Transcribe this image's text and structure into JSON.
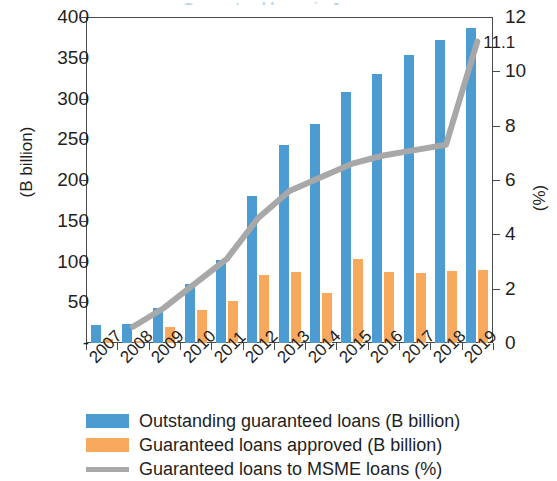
{
  "title_sliver": "Guaranteed loans in Japan",
  "chart_data": {
    "type": "bar",
    "title": "",
    "xlabel": "",
    "ylabel": "(B billion)",
    "y2label": "(%)",
    "categories": [
      "2007",
      "2008",
      "2009",
      "2010",
      "2011",
      "2012",
      "2013",
      "2014",
      "2015",
      "2016",
      "2017",
      "2018",
      "2019"
    ],
    "ylim": [
      0,
      400
    ],
    "yticks": [
      400,
      350,
      300,
      250,
      200,
      150,
      100,
      50,
      0
    ],
    "ytick_labels": [
      "400",
      "350",
      "300",
      "250",
      "200",
      "150",
      "100",
      "50",
      "-"
    ],
    "y2lim": [
      0,
      12
    ],
    "y2ticks": [
      12,
      10,
      8,
      6,
      4,
      2,
      0
    ],
    "y2tick_labels": [
      "12",
      "10",
      "8",
      "6",
      "4",
      "2",
      "0"
    ],
    "grid": false,
    "legend_position": "bottom",
    "series": [
      {
        "name": "Outstanding guaranteed loans (B billion)",
        "type": "bar",
        "axis": "left",
        "color": "#4c9bd1",
        "values": [
          22,
          23,
          43,
          72,
          102,
          180,
          243,
          269,
          308,
          330,
          353,
          372,
          387
        ]
      },
      {
        "name": "Guaranteed loans approved (B billion)",
        "type": "bar",
        "axis": "left",
        "color": "#f9a95d",
        "values": [
          5,
          3,
          20,
          41,
          52,
          83,
          87,
          61,
          103,
          87,
          86,
          88,
          89
        ]
      },
      {
        "name": "Guaranteed loans to MSME loans (%)",
        "type": "line",
        "axis": "right",
        "color": "#a8a8a8",
        "values": [
          null,
          0.6,
          1.3,
          2.2,
          3.1,
          4.6,
          5.6,
          6.1,
          6.6,
          6.9,
          7.1,
          7.3,
          11.1
        ]
      }
    ],
    "annotations": [
      {
        "label": "11.1",
        "x": "2019",
        "value": 11.1,
        "axis": "right"
      }
    ]
  },
  "legend": {
    "items": [
      {
        "label": "Outstanding guaranteed loans (B billion)",
        "swatch": "blue"
      },
      {
        "label": "Guaranteed loans approved (B billion)",
        "swatch": "orange"
      },
      {
        "label": "Guaranteed loans to MSME loans (%)",
        "swatch": "line"
      }
    ]
  }
}
